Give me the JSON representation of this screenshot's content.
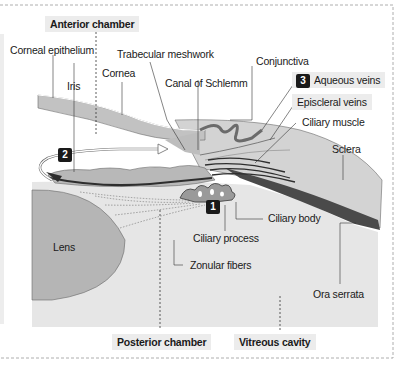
{
  "diagram": {
    "region_labels": {
      "anterior_chamber": "Anterior chamber",
      "posterior_chamber": "Posterior chamber",
      "vitreous_cavity": "Vitreous cavity"
    },
    "structure_labels": {
      "corneal_epithelium": "Corneal epithelium",
      "iris": "Iris",
      "cornea": "Cornea",
      "trabecular_meshwork": "Trabecular  meshwork",
      "canal_of_schlemm": "Canal of Schlemm",
      "conjunctiva": "Conjunctiva",
      "aqueous_veins": "Aqueous veins",
      "episcleral_veins": "Episcleral veins",
      "ciliary_muscle": "Ciliary muscle",
      "sclera": "Sclera",
      "ciliary_body": "Ciliary body",
      "ciliary_process": "Ciliary process",
      "zonular_fibers": "Zonular fibers",
      "lens": "Lens",
      "ora_serrata": "Ora serrata"
    },
    "step_badges": [
      {
        "number": "1",
        "meaning": "aqueous produced by ciliary process"
      },
      {
        "number": "2",
        "meaning": "flow through pupil into anterior chamber"
      },
      {
        "number": "3",
        "meaning": "drainage to aqueous veins"
      }
    ],
    "colors": {
      "tissue_gray": "#c9c9c9",
      "vitreous_gray": "#e6e6e6",
      "lens_gray": "#b5b5b5",
      "dark_pigment": "#3a3a3a",
      "badge_black": "#1a1a1a",
      "label_shade": "#ececec"
    }
  }
}
